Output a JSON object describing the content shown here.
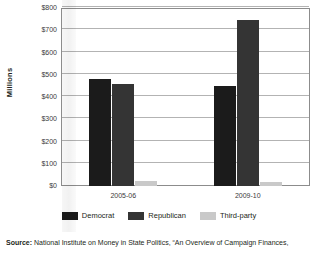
{
  "chart_data": {
    "type": "bar",
    "title": "",
    "xlabel": "",
    "ylabel": "Millions",
    "categories": [
      "2005-06",
      "2009-10"
    ],
    "series": [
      {
        "name": "Democrat",
        "color": "#1b1b1b",
        "values": [
          482,
          450
        ]
      },
      {
        "name": "Republican",
        "color": "#343434",
        "values": [
          458,
          745
        ]
      },
      {
        "name": "Third-party",
        "color": "#c9c9c9",
        "values": [
          22,
          18
        ]
      }
    ],
    "ylim": [
      0,
      800
    ],
    "ytick_values": [
      0,
      100,
      200,
      300,
      400,
      500,
      600,
      700,
      800
    ],
    "ytick_labels": [
      "$0",
      "$100",
      "$200",
      "$300",
      "$400",
      "$500",
      "$600",
      "$700",
      "$800"
    ],
    "grid": true,
    "legend_position": "bottom"
  },
  "axis": {
    "y_title": "Millions"
  },
  "legend": {
    "items": [
      {
        "label": "Democrat"
      },
      {
        "label": "Republican"
      },
      {
        "label": "Third-party"
      }
    ]
  },
  "footer": {
    "source_label": "Source:",
    "source_text": " National Institute on Money in State Politics, “An Overview of Campaign Finances,"
  }
}
